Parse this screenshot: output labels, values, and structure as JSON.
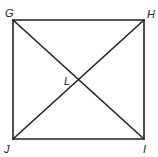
{
  "figure": {
    "type": "square-with-diagonals",
    "stroke_color": "#222222",
    "background": "#ffffff",
    "vertices": [
      {
        "name": "G",
        "x": 13,
        "y": 20
      },
      {
        "name": "H",
        "x": 144,
        "y": 20
      },
      {
        "name": "I",
        "x": 144,
        "y": 139
      },
      {
        "name": "J",
        "x": 13,
        "y": 139
      }
    ],
    "intersection": {
      "name": "L",
      "x": 78.5,
      "y": 79.5
    },
    "labels": {
      "G": "G",
      "H": "H",
      "I": "I",
      "J": "J",
      "L": "L"
    },
    "segments": [
      "GH",
      "HI",
      "IJ",
      "JG",
      "GI",
      "HJ"
    ]
  }
}
